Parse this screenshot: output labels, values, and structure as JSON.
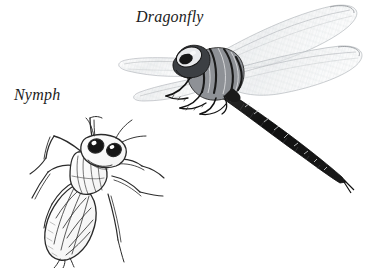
{
  "page": {
    "background_color": "#ffffff",
    "width": 377,
    "height": 268
  },
  "labels": {
    "dragonfly": "Dragonfly",
    "nymph": "Nymph"
  },
  "colors": {
    "ink": "#1c1c1c",
    "body_dark": "#111111",
    "wing_vein": "#b9bcc0",
    "wing_fill": "#f4f5f6",
    "line": "#2a2a2a",
    "shade": "#7a7d82",
    "eye_dark": "#101010",
    "paper": "#ffffff"
  },
  "figures": [
    {
      "id": "dragonfly",
      "name": "adult-dragonfly",
      "label": "Dragonfly",
      "orientation": "head upper-left, abdomen trailing to lower-right",
      "parts": [
        "head",
        "compound-eyes",
        "thorax",
        "legs",
        "forewings",
        "hindwings",
        "abdomen",
        "cerci"
      ],
      "wing_count": 4,
      "rendering": "translucent grey wings with fine venation, dark striped thorax, near-black segmented abdomen with pale chevron markings"
    },
    {
      "id": "nymph",
      "name": "dragonfly-nymph",
      "label": "Nymph",
      "orientation": "head upper-right, abdomen lower-left",
      "parts": [
        "head",
        "compound-eyes",
        "antennae",
        "thorax",
        "wing-pads",
        "legs",
        "segmented-abdomen",
        "caudal-appendages"
      ],
      "leg_count": 6,
      "abdomen_segments": 9,
      "rendering": "outline line drawing with cross-hatched lattice on abdomen, two dark oval eyes"
    }
  ]
}
